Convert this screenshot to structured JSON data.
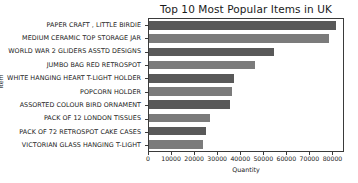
{
  "chart_data": {
    "type": "bar",
    "orientation": "horizontal",
    "title": "Top 10 Most Popular Items in UK",
    "xlabel": "Quantity",
    "ylabel": "Item",
    "categories": [
      "PAPER CRAFT , LITTLE BIRDIE",
      "MEDIUM CERAMIC TOP STORAGE JAR",
      "WORLD WAR 2 GLIDERS ASSTD DESIGNS",
      "JUMBO BAG RED RETROSPOT",
      "WHITE HANGING HEART T-LIGHT HOLDER",
      "POPCORN HOLDER",
      "ASSORTED COLOUR BIRD ORNAMENT",
      "PACK OF 12 LONDON TISSUES",
      "PACK OF 72 RETROSPOT CAKE CASES",
      "VICTORIAN GLASS HANGING T-LIGHT"
    ],
    "values": [
      80995,
      77916,
      54415,
      46181,
      36725,
      36039,
      35314,
      26437,
      24753,
      23489
    ],
    "xlim": [
      0,
      85000
    ],
    "xticks": [
      0,
      10000,
      20000,
      30000,
      40000,
      50000,
      60000,
      70000,
      80000
    ],
    "xticklabels": [
      "0",
      "10000",
      "20000",
      "30000",
      "40000",
      "50000",
      "60000",
      "70000",
      "80000"
    ],
    "grid": false,
    "legend": null,
    "bar_colors": [
      "#595959",
      "#7b7b7b"
    ]
  }
}
